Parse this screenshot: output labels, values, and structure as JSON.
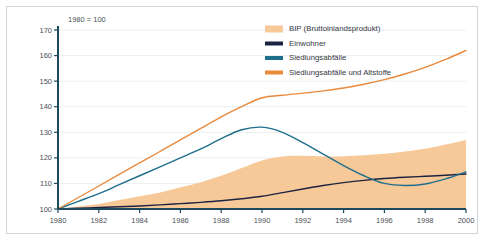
{
  "figure": {
    "index_note": "1980 = 100",
    "border_color": "#d2d4d6",
    "background": "#ffffff"
  },
  "legend": {
    "position": "top-right",
    "items": [
      {
        "label": "BIP (Bruttoinlandsprodukt)",
        "color": "#f7c999",
        "style": "area"
      },
      {
        "label": "Einwohner",
        "color": "#1b2340",
        "style": "line"
      },
      {
        "label": "Siedlungsabfälle",
        "color": "#1f6e8c",
        "style": "line"
      },
      {
        "label": "Siedlungsabfälle und Altstoffe",
        "color": "#e8893c",
        "style": "line"
      }
    ]
  },
  "chart_data": {
    "type": "line",
    "title": "",
    "subtitle": "",
    "xlabel": "",
    "ylabel": "",
    "xlim": [
      1980,
      2000
    ],
    "ylim": [
      100,
      170
    ],
    "yticks": [
      100,
      110,
      120,
      130,
      140,
      150,
      160,
      170
    ],
    "xticks": [
      1980,
      1982,
      1984,
      1986,
      1988,
      1990,
      1992,
      1994,
      1996,
      1998,
      2000
    ],
    "grid": true,
    "legend_position": "top-right",
    "annotations": [
      "1980 = 100"
    ],
    "x": [
      1980,
      1981,
      1982,
      1983,
      1984,
      1985,
      1986,
      1987,
      1988,
      1989,
      1990,
      1991,
      1992,
      1993,
      1994,
      1995,
      1996,
      1997,
      1998,
      1999,
      2000
    ],
    "series": [
      {
        "name": "BIP (Bruttoinlandsprodukt)",
        "type": "area",
        "color": "#f7c999",
        "values": [
          100,
          101,
          102,
          103.5,
          105,
          106.5,
          108.5,
          110.5,
          113,
          116,
          119,
          120.5,
          120.8,
          120.5,
          120.6,
          121,
          121.6,
          122.5,
          123.6,
          125.2,
          127
        ]
      },
      {
        "name": "Einwohner",
        "type": "line",
        "color": "#1b2340",
        "values": [
          100,
          100.3,
          100.6,
          100.9,
          101.2,
          101.6,
          102.1,
          102.6,
          103.2,
          104,
          105,
          106.4,
          107.8,
          109.2,
          110.3,
          111.2,
          111.9,
          112.4,
          112.8,
          113.2,
          113.7
        ]
      },
      {
        "name": "Siedlungsabfälle",
        "type": "line",
        "color": "#1f6e8c",
        "values": [
          100,
          103,
          106,
          109.5,
          113,
          116.5,
          120,
          123.5,
          127.5,
          131,
          132,
          130,
          126,
          121.5,
          117,
          113,
          110,
          109.2,
          109.8,
          111.8,
          114.5
        ]
      },
      {
        "name": "Siedlungsabfälle und Altstoffe",
        "type": "line",
        "color": "#e8893c",
        "values": [
          100,
          104.5,
          109,
          113.5,
          118,
          122.5,
          127,
          131.5,
          136,
          140,
          143.5,
          144.5,
          145.3,
          146.2,
          147.3,
          148.8,
          150.6,
          152.8,
          155.4,
          158.5,
          162
        ]
      }
    ]
  }
}
